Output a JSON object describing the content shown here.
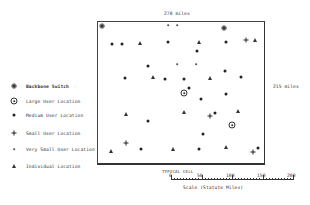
{
  "diagram": {
    "width_label": "270 miles",
    "height_label": "215 miles",
    "caption": "TYPICAL CELL"
  },
  "legend": {
    "items": [
      {
        "symbol": "backbone-switch",
        "label": "Backbone Switch"
      },
      {
        "symbol": "large-user",
        "label": "Large User Location"
      },
      {
        "symbol": "medium-user",
        "label": "Medium User Location"
      },
      {
        "symbol": "small-user",
        "label": "Small User Location"
      },
      {
        "symbol": "very-small-user",
        "label": "Very Small User Location"
      },
      {
        "symbol": "individual",
        "label": "Individual Location"
      }
    ]
  },
  "scale": {
    "ticks": [
      "0",
      "50",
      "100",
      "150",
      "200"
    ],
    "label": "Scale  (Statute Miles)"
  },
  "points": [
    {
      "type": "backbone-switch",
      "x": 102,
      "y": 26
    },
    {
      "type": "medium-user",
      "x": 112,
      "y": 44
    },
    {
      "type": "medium-user",
      "x": 122,
      "y": 44
    },
    {
      "type": "individual",
      "x": 140,
      "y": 43
    },
    {
      "type": "very-small-user",
      "x": 168,
      "y": 25
    },
    {
      "type": "very-small-user",
      "x": 177,
      "y": 25
    },
    {
      "type": "backbone-switch",
      "x": 224,
      "y": 28
    },
    {
      "type": "medium-user",
      "x": 168,
      "y": 42
    },
    {
      "type": "individual",
      "x": 199,
      "y": 42
    },
    {
      "type": "medium-user",
      "x": 226,
      "y": 42
    },
    {
      "type": "small-user",
      "x": 246,
      "y": 40
    },
    {
      "type": "individual",
      "x": 255,
      "y": 40
    },
    {
      "type": "medium-user",
      "x": 148,
      "y": 66
    },
    {
      "type": "medium-user",
      "x": 197,
      "y": 51
    },
    {
      "type": "very-small-user",
      "x": 177,
      "y": 64
    },
    {
      "type": "very-small-user",
      "x": 196,
      "y": 64
    },
    {
      "type": "medium-user",
      "x": 225,
      "y": 71
    },
    {
      "type": "medium-user",
      "x": 125,
      "y": 78
    },
    {
      "type": "individual",
      "x": 153,
      "y": 77
    },
    {
      "type": "medium-user",
      "x": 165,
      "y": 79
    },
    {
      "type": "medium-user",
      "x": 184,
      "y": 79
    },
    {
      "type": "individual",
      "x": 210,
      "y": 78
    },
    {
      "type": "medium-user",
      "x": 241,
      "y": 77
    },
    {
      "type": "large-user",
      "x": 184,
      "y": 93
    },
    {
      "type": "medium-user",
      "x": 189,
      "y": 88
    },
    {
      "type": "medium-user",
      "x": 201,
      "y": 99
    },
    {
      "type": "medium-user",
      "x": 226,
      "y": 94
    },
    {
      "type": "individual",
      "x": 126,
      "y": 114
    },
    {
      "type": "medium-user",
      "x": 148,
      "y": 121
    },
    {
      "type": "individual",
      "x": 184,
      "y": 112
    },
    {
      "type": "small-user",
      "x": 210,
      "y": 116
    },
    {
      "type": "medium-user",
      "x": 215,
      "y": 113
    },
    {
      "type": "individual",
      "x": 238,
      "y": 111
    },
    {
      "type": "large-user",
      "x": 232,
      "y": 125
    },
    {
      "type": "medium-user",
      "x": 203,
      "y": 134
    },
    {
      "type": "small-user",
      "x": 126,
      "y": 143
    },
    {
      "type": "individual",
      "x": 111,
      "y": 151
    },
    {
      "type": "medium-user",
      "x": 141,
      "y": 149
    },
    {
      "type": "individual",
      "x": 173,
      "y": 149
    },
    {
      "type": "medium-user",
      "x": 199,
      "y": 149
    },
    {
      "type": "individual",
      "x": 226,
      "y": 147
    },
    {
      "type": "small-user",
      "x": 253,
      "y": 152
    },
    {
      "type": "medium-user",
      "x": 258,
      "y": 148
    }
  ]
}
